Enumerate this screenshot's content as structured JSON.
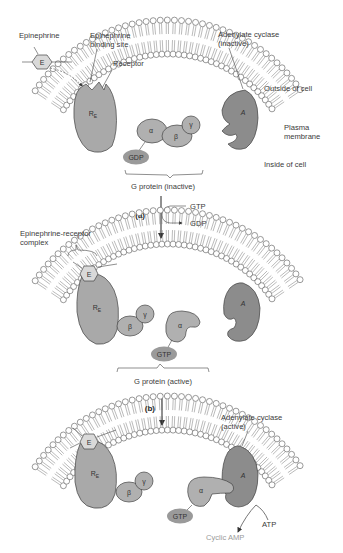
{
  "diagram": {
    "panels": [
      {
        "id": "panel-1",
        "labels": {
          "epinephrine": "Epinephrine",
          "binding_site": "Epinephrine binding site",
          "binding_site_line1": "Epinephrine",
          "binding_site_line2": "binding site",
          "receptor": "Receptor",
          "adenylate_cyclase_line1": "Adenylate cyclase",
          "adenylate_cyclase_line2": "(inactive)",
          "outside": "Outside of cell",
          "plasma_line1": "Plasma",
          "plasma_line2": "membrane",
          "inside": "Inside of cell",
          "g_protein": "G protein (inactive)",
          "nucleotide": "GDP"
        }
      },
      {
        "id": "panel-2",
        "labels": {
          "complex_line1": "Epinephrine-receptor",
          "complex_line2": "complex",
          "g_protein": "G protein (active)",
          "nucleotide": "GTP"
        }
      },
      {
        "id": "panel-3",
        "labels": {
          "adenylate_cyclase_line1": "Adenylate cyclase",
          "adenylate_cyclase_line2": "(active)",
          "nucleotide": "GTP",
          "atp": "ATP",
          "cyclic_amp": "Cyclic AMP"
        }
      }
    ],
    "steps": [
      {
        "label": "(a)",
        "input": "GTP",
        "output": "GDP"
      },
      {
        "label": "(b)"
      }
    ],
    "glyphs": {
      "epinephrine": "E",
      "receptor": "R",
      "receptor_sub": "E",
      "adenylate": "A",
      "alpha": "α",
      "beta": "β",
      "gamma": "γ"
    },
    "colors": {
      "receptor": "#a9a9a9",
      "adenylate_cyclase": "#8c8c8c",
      "g_subunit": "#b0b0b0",
      "nucleotide": "#9a9a9a",
      "epinephrine": "#d9d9d9",
      "cyclic_amp_text": "#9a9a9a"
    }
  }
}
